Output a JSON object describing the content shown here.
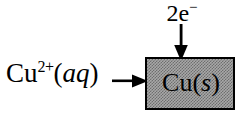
{
  "diagram": {
    "reactant": {
      "species": "Cu",
      "charge": "2+",
      "state_open": "(",
      "state": "aq",
      "state_close": ")"
    },
    "electrons": {
      "count": "2",
      "symbol": "e",
      "charge": "−"
    },
    "product": {
      "species": "Cu",
      "state_open": "(",
      "state": "s",
      "state_close": ")"
    },
    "arrows": {
      "horizontal_direction": "right",
      "vertical_direction": "down",
      "color": "#000000"
    },
    "colors": {
      "background": "#ffffff",
      "text": "#000000",
      "box_border": "#000000",
      "box_fill": "#a8a8a8",
      "box_fill_dither": "#6e6e6e"
    }
  }
}
